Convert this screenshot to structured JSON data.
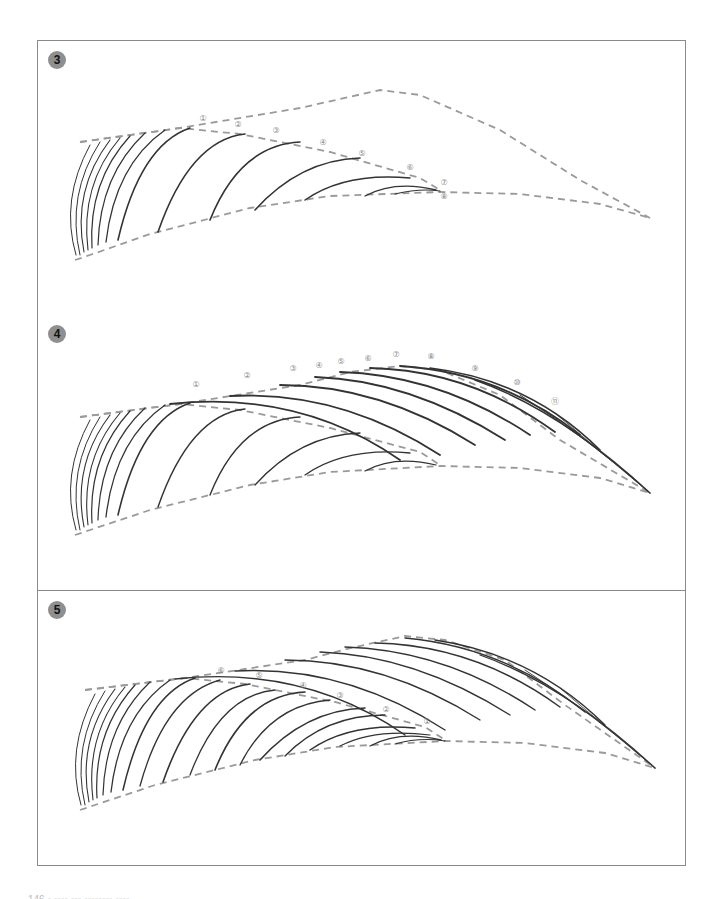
{
  "figure": {
    "colors": {
      "frame": "#8a8a8a",
      "badge": "#8f8f8f",
      "guide": "#9a9a9a",
      "hair": "#333333",
      "label": "#888888"
    }
  },
  "panels": [
    {
      "step": "3",
      "guides": [
        "M75,260 L90,255 L150,234 L250,208 L330,196 L440,192 L520,194 L600,204 L650,218",
        "M80,142 L180,128 L300,108 L380,90 L420,95 L500,130 L580,180 L650,218",
        "M80,142 L180,128 L240,134 L330,152 L420,178 L440,190"
      ],
      "strokes": [
        {
          "d": "M76,255 Q60,200 90,145",
          "w": 1
        },
        {
          "d": "M80,255 Q66,195 100,142",
          "w": 1
        },
        {
          "d": "M84,252 Q72,190 110,140",
          "w": 1.1
        },
        {
          "d": "M88,250 Q80,185 120,138",
          "w": 1.1
        },
        {
          "d": "M92,248 Q88,182 130,136",
          "w": 1.2
        },
        {
          "d": "M98,245 Q100,175 145,133",
          "w": 1.2
        },
        {
          "d": "M106,242 Q115,165 165,130",
          "w": 1.3
        },
        {
          "d": "M118,240 Q140,145 190,128",
          "w": 1.6
        },
        {
          "d": "M158,232 Q190,140 245,134",
          "w": 1.6
        },
        {
          "d": "M210,220 Q240,145 300,142",
          "w": 1.6
        },
        {
          "d": "M255,210 Q300,160 360,158",
          "w": 1.6
        },
        {
          "d": "M305,200 Q345,172 410,178",
          "w": 1.5
        },
        {
          "d": "M365,196 Q395,180 436,190",
          "w": 1.4
        },
        {
          "d": "M395,194 Q420,188 440,191",
          "w": 1.2
        }
      ],
      "labels": [
        {
          "text": "①",
          "x": 203,
          "y": 121
        },
        {
          "text": "②",
          "x": 238,
          "y": 127
        },
        {
          "text": "③",
          "x": 276,
          "y": 133
        },
        {
          "text": "④",
          "x": 323,
          "y": 145
        },
        {
          "text": "⑤",
          "x": 362,
          "y": 156
        },
        {
          "text": "⑥",
          "x": 410,
          "y": 170
        },
        {
          "text": "⑦",
          "x": 444,
          "y": 185
        },
        {
          "text": "⑧",
          "x": 444,
          "y": 199
        }
      ]
    },
    {
      "step": "4",
      "guides": [
        "M75,535 L90,530 L150,510 L250,485 L330,472 L440,466 L520,468 L600,478 L650,493",
        "M80,417 L180,404 L300,385 L350,372 L400,366 L440,370 L500,395 L560,440 L650,493",
        "M80,417 L180,404 L240,410 L330,428 L420,452 L440,465"
      ],
      "strokes": [
        {
          "d": "M76,530 Q60,475 90,420",
          "w": 1
        },
        {
          "d": "M80,530 Q66,470 100,417",
          "w": 1
        },
        {
          "d": "M84,527 Q72,465 110,415",
          "w": 1.1
        },
        {
          "d": "M88,525 Q80,460 120,413",
          "w": 1.1
        },
        {
          "d": "M92,523 Q88,457 130,411",
          "w": 1.2
        },
        {
          "d": "M98,520 Q100,450 145,408",
          "w": 1.2
        },
        {
          "d": "M106,517 Q115,440 165,405",
          "w": 1.3
        },
        {
          "d": "M118,515 Q140,420 190,403",
          "w": 1.6
        },
        {
          "d": "M158,507 Q190,415 245,409",
          "w": 1.4
        },
        {
          "d": "M210,495 Q240,420 300,417",
          "w": 1.4
        },
        {
          "d": "M255,485 Q300,435 360,433",
          "w": 1.3
        },
        {
          "d": "M305,475 Q345,447 410,453",
          "w": 1.3
        },
        {
          "d": "M365,471 Q395,455 436,465",
          "w": 1.2
        },
        {
          "d": "M170,404 Q300,390 400,460",
          "w": 1.8
        },
        {
          "d": "M230,396 Q340,390 440,455",
          "w": 1.8
        },
        {
          "d": "M280,385 Q380,385 475,445",
          "w": 1.8
        },
        {
          "d": "M315,377 Q410,380 505,440",
          "w": 1.8
        },
        {
          "d": "M340,372 Q440,375 530,435",
          "w": 1.8
        },
        {
          "d": "M370,368 Q470,370 555,432",
          "w": 1.8
        },
        {
          "d": "M400,366 Q500,372 580,435",
          "w": 1.8
        },
        {
          "d": "M430,368 Q530,380 600,450",
          "w": 1.6
        },
        {
          "d": "M475,380 Q560,410 650,493",
          "w": 1.5
        },
        {
          "d": "M520,395 Q590,440 650,493",
          "w": 1
        },
        {
          "d": "M555,413 Q610,460 650,493",
          "w": 0.8
        }
      ],
      "labels": [
        {
          "text": "①",
          "x": 196,
          "y": 387
        },
        {
          "text": "②",
          "x": 247,
          "y": 378
        },
        {
          "text": "③",
          "x": 293,
          "y": 371
        },
        {
          "text": "④",
          "x": 319,
          "y": 368
        },
        {
          "text": "⑤",
          "x": 341,
          "y": 364
        },
        {
          "text": "⑥",
          "x": 368,
          "y": 361
        },
        {
          "text": "⑦",
          "x": 396,
          "y": 357
        },
        {
          "text": "⑧",
          "x": 431,
          "y": 359
        },
        {
          "text": "⑨",
          "x": 475,
          "y": 371
        },
        {
          "text": "⑩",
          "x": 517,
          "y": 385
        },
        {
          "text": "⑪",
          "x": 555,
          "y": 404
        }
      ]
    },
    {
      "step": "5",
      "guides": [
        "M80,810 L95,805 L155,785 L255,760 L335,747 L445,741 L525,743 L605,753 L655,768",
        "M85,690 L185,678 L305,660 L355,647 L405,636 L445,640 L505,660 L565,705 L655,768",
        "M85,690 L185,678 L245,684 L335,702 L425,727 L445,740"
      ],
      "strokes": [
        {
          "d": "M81,805 Q65,750 95,694",
          "w": 1
        },
        {
          "d": "M85,805 Q71,745 105,691",
          "w": 1
        },
        {
          "d": "M89,802 Q77,740 115,689",
          "w": 1.1
        },
        {
          "d": "M93,800 Q85,735 125,687",
          "w": 1.1
        },
        {
          "d": "M97,798 Q93,732 135,685",
          "w": 1.2
        },
        {
          "d": "M103,795 Q105,725 150,682",
          "w": 1.2
        },
        {
          "d": "M111,792 Q120,715 170,680",
          "w": 1.3
        },
        {
          "d": "M123,790 Q145,695 195,678",
          "w": 1.5
        },
        {
          "d": "M140,786 Q165,695 220,680",
          "w": 1.3
        },
        {
          "d": "M163,782 Q195,690 250,684",
          "w": 1.6
        },
        {
          "d": "M190,775 Q220,695 275,690",
          "w": 1.3
        },
        {
          "d": "M215,770 Q245,695 305,692",
          "w": 1.6
        },
        {
          "d": "M240,765 Q270,705 330,700",
          "w": 1.3
        },
        {
          "d": "M260,760 Q305,710 365,708",
          "w": 1.6
        },
        {
          "d": "M285,756 Q325,715 385,715",
          "w": 1.3
        },
        {
          "d": "M310,750 Q350,722 415,728",
          "w": 1.5
        },
        {
          "d": "M340,746 Q375,728 430,735",
          "w": 1.2
        },
        {
          "d": "M370,746 Q400,730 441,740",
          "w": 1.3
        },
        {
          "d": "M395,744 Q420,737 445,741",
          "w": 1.1
        },
        {
          "d": "M175,679 Q305,665 405,735",
          "w": 1.4
        },
        {
          "d": "M235,671 Q345,665 445,730",
          "w": 1.4
        },
        {
          "d": "M285,660 Q385,660 480,720",
          "w": 1.4
        },
        {
          "d": "M320,652 Q415,655 510,715",
          "w": 1.4
        },
        {
          "d": "M345,647 Q445,650 535,710",
          "w": 1.4
        },
        {
          "d": "M375,643 Q475,645 560,707",
          "w": 1.4
        },
        {
          "d": "M405,638 Q505,647 585,712",
          "w": 1.4
        },
        {
          "d": "M435,640 Q535,655 605,725",
          "w": 1.4
        },
        {
          "d": "M480,655 Q565,685 655,768",
          "w": 1.3
        },
        {
          "d": "M525,670 Q595,715 655,768",
          "w": 0.9
        },
        {
          "d": "M560,688 Q615,735 655,768",
          "w": 0.8
        }
      ],
      "labels": [
        {
          "text": "⑥",
          "x": 221,
          "y": 673
        },
        {
          "text": "⑤",
          "x": 259,
          "y": 678
        },
        {
          "text": "④",
          "x": 303,
          "y": 688
        },
        {
          "text": "③",
          "x": 340,
          "y": 698
        },
        {
          "text": "②",
          "x": 386,
          "y": 712
        },
        {
          "text": "①",
          "x": 427,
          "y": 724
        }
      ]
    }
  ],
  "footer": {
    "text": "146 ▪ ▪▪▪▪ ▪▪▪ ▪▪▪▪▪▪▪▪ ▪▪▪▪"
  }
}
